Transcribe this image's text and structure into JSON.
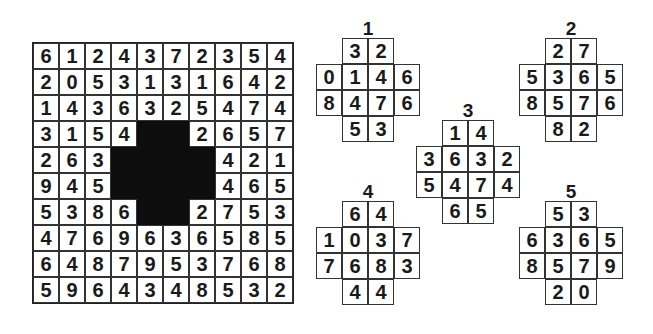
{
  "puzzle": {
    "grid": {
      "rows": [
        [
          "6",
          "1",
          "2",
          "4",
          "3",
          "7",
          "2",
          "3",
          "5",
          "4"
        ],
        [
          "2",
          "0",
          "5",
          "3",
          "1",
          "3",
          "1",
          "6",
          "4",
          "2"
        ],
        [
          "1",
          "4",
          "3",
          "6",
          "3",
          "2",
          "5",
          "4",
          "7",
          "4"
        ],
        [
          "3",
          "1",
          "5",
          "4",
          "#",
          "#",
          "2",
          "6",
          "5",
          "7"
        ],
        [
          "2",
          "6",
          "3",
          "#",
          "#",
          "#",
          "#",
          "4",
          "2",
          "1"
        ],
        [
          "9",
          "4",
          "5",
          "#",
          "#",
          "#",
          "#",
          "4",
          "6",
          "5"
        ],
        [
          "5",
          "3",
          "8",
          "6",
          "#",
          "#",
          "2",
          "7",
          "5",
          "3"
        ],
        [
          "4",
          "7",
          "6",
          "9",
          "6",
          "3",
          "6",
          "5",
          "8",
          "5"
        ],
        [
          "6",
          "4",
          "8",
          "7",
          "9",
          "5",
          "3",
          "7",
          "6",
          "8"
        ],
        [
          "5",
          "9",
          "6",
          "4",
          "3",
          "4",
          "8",
          "5",
          "3",
          "2"
        ]
      ]
    },
    "pieces": [
      {
        "label": "1",
        "left": 316,
        "top": 18,
        "cells": [
          [
            "",
            "3",
            "2",
            ""
          ],
          [
            "0",
            "1",
            "4",
            "6"
          ],
          [
            "8",
            "4",
            "7",
            "6"
          ],
          [
            "",
            "5",
            "3",
            ""
          ]
        ]
      },
      {
        "label": "2",
        "left": 519,
        "top": 18,
        "cells": [
          [
            "",
            "2",
            "7",
            ""
          ],
          [
            "5",
            "3",
            "6",
            "5"
          ],
          [
            "8",
            "5",
            "7",
            "6"
          ],
          [
            "",
            "8",
            "2",
            ""
          ]
        ]
      },
      {
        "label": "3",
        "left": 416,
        "top": 100,
        "cells": [
          [
            "",
            "1",
            "4",
            ""
          ],
          [
            "3",
            "6",
            "3",
            "2"
          ],
          [
            "5",
            "4",
            "7",
            "4"
          ],
          [
            "",
            "6",
            "5",
            ""
          ]
        ]
      },
      {
        "label": "4",
        "left": 316,
        "top": 181,
        "cells": [
          [
            "",
            "6",
            "4",
            ""
          ],
          [
            "1",
            "0",
            "3",
            "7"
          ],
          [
            "7",
            "6",
            "8",
            "3"
          ],
          [
            "",
            "4",
            "4",
            ""
          ]
        ]
      },
      {
        "label": "5",
        "left": 519,
        "top": 181,
        "cells": [
          [
            "",
            "5",
            "3",
            ""
          ],
          [
            "6",
            "3",
            "6",
            "5"
          ],
          [
            "8",
            "5",
            "7",
            "9"
          ],
          [
            "",
            "2",
            "0",
            ""
          ]
        ]
      }
    ]
  }
}
